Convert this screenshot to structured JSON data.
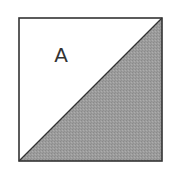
{
  "figure": {
    "label": "A",
    "square": {
      "x": 19,
      "y": 18,
      "size": 143
    },
    "colors": {
      "background": "#ffffff",
      "border": "#333333",
      "shaded_region": "#9c9c9c",
      "unshaded_region": "#ffffff",
      "label": "#333333"
    },
    "regions": [
      {
        "name": "upper-left-triangle",
        "shaded": false,
        "label": "A"
      },
      {
        "name": "lower-right-triangle",
        "shaded": true
      }
    ]
  }
}
